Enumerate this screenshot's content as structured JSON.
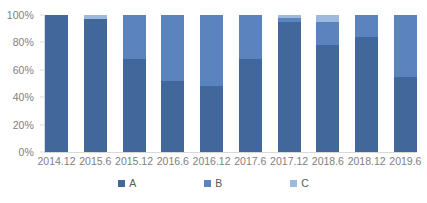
{
  "chart_data": {
    "type": "bar",
    "subtype": "stacked-percent",
    "title": "",
    "xlabel": "",
    "ylabel": "",
    "ylim": [
      0,
      100
    ],
    "ytick_labels": [
      "100%",
      "80%",
      "60%",
      "40%",
      "20%",
      "0%"
    ],
    "ytick_values": [
      100,
      80,
      60,
      40,
      20,
      0
    ],
    "grid": false,
    "legend_position": "bottom",
    "categories": [
      "2014.12",
      "2015.6",
      "2015.12",
      "2016.6",
      "2016.12",
      "2017.6",
      "2017.12",
      "2018.6",
      "2018.12",
      "2019.6"
    ],
    "series": [
      {
        "name": "A",
        "color": "#41679B",
        "values": [
          100,
          97,
          68,
          52,
          48,
          68,
          95,
          78,
          84,
          55
        ]
      },
      {
        "name": "B",
        "color": "#5B84BE",
        "values": [
          0,
          0,
          32,
          48,
          52,
          32,
          3,
          17,
          16,
          45
        ]
      },
      {
        "name": "C",
        "color": "#9EB9DE",
        "values": [
          0,
          3,
          0,
          0,
          0,
          0,
          2,
          5,
          0,
          0
        ]
      }
    ]
  },
  "legend": {
    "items": [
      {
        "label": "A",
        "color": "#41679B"
      },
      {
        "label": "B",
        "color": "#5B84BE"
      },
      {
        "label": "C",
        "color": "#9EB9DE"
      }
    ]
  },
  "colors": {
    "axis": "#d9d9d9",
    "tick_text": "#808080",
    "legend_text": "#595959",
    "background": "#ffffff"
  }
}
